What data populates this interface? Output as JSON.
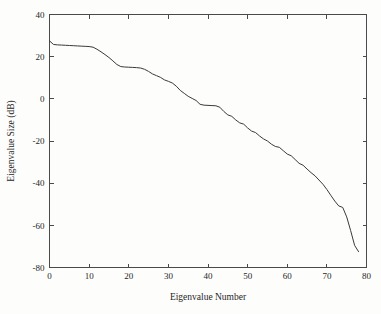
{
  "figure": {
    "background_color": "#fdfdfc",
    "line_color": "#3a3a3a",
    "axis_color": "#4a4a4a"
  },
  "chart_data": {
    "type": "line",
    "title": "",
    "xlabel": "Eigenvalue Number",
    "ylabel": "Eigenvalue Size (dB)",
    "xlim": [
      0,
      80
    ],
    "ylim": [
      -80,
      40
    ],
    "xticks": [
      0,
      10,
      20,
      30,
      40,
      50,
      60,
      70,
      80
    ],
    "xtick_labels": [
      "0",
      "10",
      "20",
      "30",
      "40",
      "50",
      "60",
      "70",
      "80"
    ],
    "yticks": [
      -80,
      -60,
      -40,
      -20,
      0,
      20,
      40
    ],
    "ytick_labels": [
      "-80",
      "-60",
      "-40",
      "-20",
      "0",
      "20",
      "40"
    ],
    "grid": false,
    "legend": null,
    "series": [
      {
        "name": "eigenvalue-spectrum",
        "x": [
          0,
          1,
          2,
          3,
          4,
          5,
          6,
          7,
          8,
          9,
          10,
          11,
          12,
          13,
          14,
          15,
          16,
          17,
          18,
          19,
          20,
          21,
          22,
          23,
          24,
          25,
          26,
          27,
          28,
          29,
          30,
          31,
          32,
          33,
          34,
          35,
          36,
          37,
          38,
          39,
          40,
          41,
          42,
          43,
          44,
          45,
          46,
          47,
          48,
          49,
          50,
          51,
          52,
          53,
          54,
          55,
          56,
          57,
          58,
          59,
          60,
          61,
          62,
          63,
          64,
          65,
          66,
          67,
          68,
          69,
          70,
          71,
          72,
          73,
          74,
          75,
          76,
          77,
          78
        ],
        "y": [
          27.5,
          25.8,
          25.6,
          25.5,
          25.4,
          25.3,
          25.2,
          25.1,
          25.0,
          24.9,
          24.8,
          24.5,
          23.5,
          22.3,
          21.0,
          19.6,
          18.0,
          16.3,
          15.3,
          15.1,
          15.0,
          14.9,
          14.8,
          14.6,
          14.0,
          13.0,
          11.8,
          11.0,
          10.2,
          9.0,
          8.3,
          7.5,
          6.0,
          4.0,
          2.6,
          1.2,
          0.2,
          -0.8,
          -2.6,
          -3.0,
          -3.1,
          -3.2,
          -3.3,
          -4.0,
          -6.0,
          -7.6,
          -8.3,
          -10.0,
          -11.4,
          -12.0,
          -13.8,
          -15.3,
          -16.0,
          -17.6,
          -19.0,
          -20.0,
          -21.5,
          -22.6,
          -23.0,
          -24.6,
          -26.2,
          -27.0,
          -28.8,
          -30.6,
          -31.5,
          -33.3,
          -35.0,
          -36.5,
          -38.5,
          -40.5,
          -43.0,
          -45.8,
          -48.5,
          -50.8,
          -51.5,
          -56.0,
          -62.5,
          -69.5,
          -72.5
        ]
      }
    ]
  }
}
